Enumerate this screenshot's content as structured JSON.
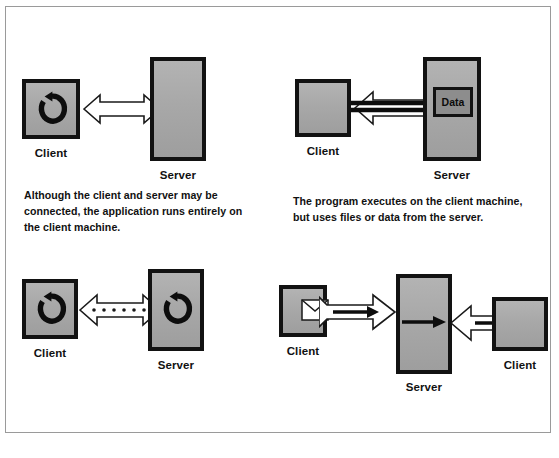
{
  "figure": {
    "border_color": "#9a9a9a",
    "background": "#ffffff",
    "box_fill": "#aaaaaa",
    "box_border": "#121212",
    "arrow_fill": "#ffffff",
    "arrow_stroke": "#1a1a1a",
    "data_box_fill": "#8d8d8d"
  },
  "panels": [
    {
      "id": "standalone",
      "caption": "Although the client and server may be connected, the application runs entirely on the client machine.",
      "nodes": [
        {
          "label": "Client",
          "icon": "cycle-icon",
          "shape": "square"
        },
        {
          "label": "Server",
          "icon": "none",
          "shape": "tall"
        }
      ],
      "connector": {
        "type": "double-arrow-hollow",
        "overlay": "none"
      }
    },
    {
      "id": "file-sharing",
      "caption": "The program executes on the client machine, but uses files or data from the server.",
      "nodes": [
        {
          "label": "Client",
          "icon": "none",
          "shape": "square"
        },
        {
          "label": "Server",
          "icon": "none",
          "shape": "tall"
        }
      ],
      "connector": {
        "type": "double-arrow-hollow",
        "overlay": "black-arrow-left"
      },
      "data_label": "Data"
    },
    {
      "id": "client-server",
      "caption": "",
      "nodes": [
        {
          "label": "Client",
          "icon": "cycle-icon",
          "shape": "square"
        },
        {
          "label": "Server",
          "icon": "cycle-icon",
          "shape": "tall"
        }
      ],
      "connector": {
        "type": "double-arrow-hollow",
        "overlay": "dotted-line"
      }
    },
    {
      "id": "messaging",
      "caption": "",
      "nodes": [
        {
          "label": "Client",
          "icon": "envelope-icon",
          "shape": "square"
        },
        {
          "label": "Server",
          "icon": "none",
          "shape": "tall"
        },
        {
          "label": "Client",
          "icon": "envelope-icon",
          "shape": "square"
        }
      ],
      "connector": {
        "type": "single-arrow-hollow",
        "overlay": "black-arrow-right"
      }
    }
  ],
  "footer": {
    "text": ""
  }
}
